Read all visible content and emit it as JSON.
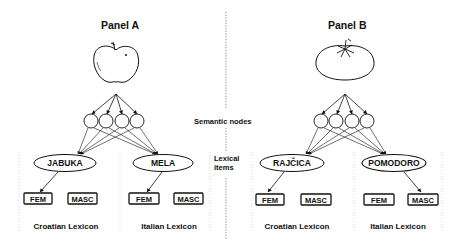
{
  "panels": [
    {
      "title": "Panel A",
      "picture": "apple",
      "lexicons": [
        {
          "label": "Croatian Lexicon",
          "word": "JABUKA",
          "genders": [
            "FEM",
            "MASC"
          ],
          "selected_gender": "FEM"
        },
        {
          "label": "Italian Lexicon",
          "word": "MELA",
          "genders": [
            "FEM",
            "MASC"
          ],
          "selected_gender": "FEM"
        }
      ],
      "semantic_node_count": 4
    },
    {
      "title": "Panel B",
      "picture": "tomato",
      "lexicons": [
        {
          "label": "Croatian Lexicon",
          "word": "RAJČICA",
          "genders": [
            "FEM",
            "MASC"
          ],
          "selected_gender": "FEM"
        },
        {
          "label": "Italian Lexicon",
          "word": "POMODORO",
          "genders": [
            "FEM",
            "MASC"
          ],
          "selected_gender": "MASC"
        }
      ],
      "semantic_node_count": 4
    }
  ],
  "center_labels": {
    "semantic_nodes": "Semantic nodes",
    "lexical_line1": "Lexical",
    "lexical_line2": "items"
  },
  "colors": {
    "ink": "#111111",
    "background": "#ffffff",
    "divider": "#999999"
  }
}
